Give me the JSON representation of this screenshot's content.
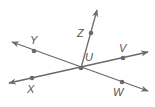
{
  "diagram": {
    "type": "geometry-lines-and-rays",
    "line_color": "#6a6a6a",
    "center": {
      "name": "U",
      "x": 81,
      "y": 68,
      "label": "U",
      "label_x": 85,
      "label_y": 61
    },
    "points": [
      {
        "name": "Z",
        "label": "Z",
        "x": 91,
        "y": 33,
        "label_x": 77,
        "label_y": 37
      },
      {
        "name": "Y",
        "label": "Y",
        "x": 34,
        "y": 51,
        "label_x": 30,
        "label_y": 44
      },
      {
        "name": "V",
        "label": "V",
        "x": 123,
        "y": 58,
        "label_x": 119,
        "label_y": 52
      },
      {
        "name": "X",
        "label": "X",
        "x": 32,
        "y": 78,
        "label_x": 27,
        "label_y": 93
      },
      {
        "name": "W",
        "label": "W",
        "x": 122,
        "y": 82,
        "label_x": 113,
        "label_y": 96
      }
    ],
    "lines": [
      {
        "name": "line-YW",
        "from": {
          "x": 12,
          "y": 42
        },
        "to": {
          "x": 148,
          "y": 91
        },
        "arrows": "both"
      },
      {
        "name": "line-XV",
        "from": {
          "x": 9,
          "y": 83
        },
        "to": {
          "x": 148,
          "y": 52
        },
        "arrows": "both"
      },
      {
        "name": "ray-UZ",
        "from": {
          "x": 81,
          "y": 68
        },
        "to": {
          "x": 97,
          "y": 10
        },
        "arrows": "end"
      }
    ]
  }
}
